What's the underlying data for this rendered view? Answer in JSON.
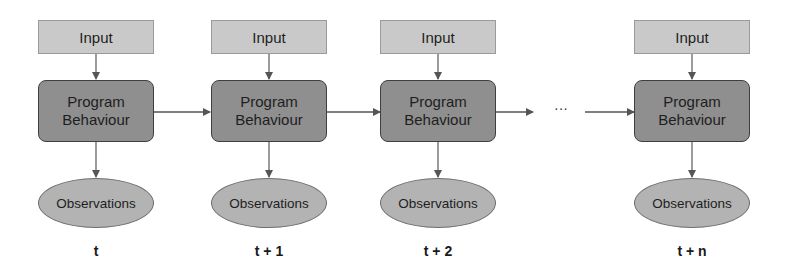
{
  "diagram": {
    "type": "time-series flow",
    "colors": {
      "input_fill": "#c9c9c9",
      "program_fill": "#8f8f8f",
      "observations_fill": "#b3b3b3",
      "arrow": "#555555"
    },
    "ellipsis": "···",
    "columns": [
      {
        "input": "Input",
        "program_line1": "Program",
        "program_line2": "Behaviour",
        "observations": "Observations",
        "time": "t"
      },
      {
        "input": "Input",
        "program_line1": "Program",
        "program_line2": "Behaviour",
        "observations": "Observations",
        "time": "t + 1"
      },
      {
        "input": "Input",
        "program_line1": "Program",
        "program_line2": "Behaviour",
        "observations": "Observations",
        "time": "t + 2"
      },
      {
        "input": "Input",
        "program_line1": "Program",
        "program_line2": "Behaviour",
        "observations": "Observations",
        "time": "t + n"
      }
    ]
  }
}
